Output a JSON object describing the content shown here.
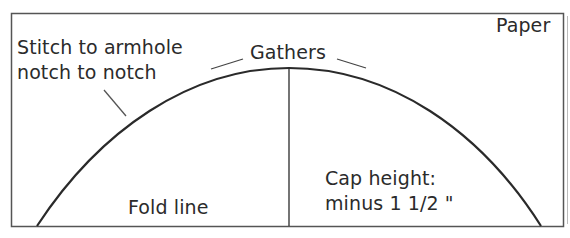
{
  "diagram": {
    "type": "sleeve cap pattern drafting diagram",
    "labels": {
      "paper": "Paper",
      "stitch_line1": "Stitch to armhole",
      "stitch_line2": "notch to notch",
      "gathers": "Gathers",
      "fold_line": "Fold line",
      "cap_line1": "Cap height:",
      "cap_line2": "minus 1 1/2 \""
    },
    "colors": {
      "stroke": "#2a2a2a",
      "border": "#555555",
      "background": "#ffffff"
    }
  }
}
